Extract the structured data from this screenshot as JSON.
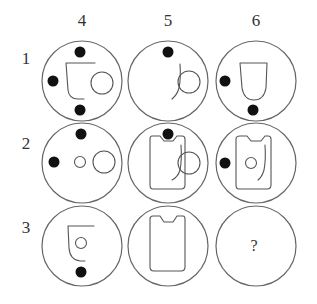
{
  "puzzle": {
    "column_labels": [
      "4",
      "5",
      "6"
    ],
    "row_labels": [
      "1",
      "2",
      "3"
    ],
    "missing_cell_mark": "?",
    "cells": [
      {
        "row": "1",
        "col": "4",
        "contents": [
          "cup-outline",
          "large-circle",
          "dot-top",
          "dot-left",
          "dot-bottom"
        ]
      },
      {
        "row": "1",
        "col": "5",
        "contents": [
          "hook-curve",
          "large-circle",
          "dot-top"
        ]
      },
      {
        "row": "1",
        "col": "6",
        "contents": [
          "tumbler-outline",
          "dot-left",
          "dot-bottom"
        ]
      },
      {
        "row": "2",
        "col": "4",
        "contents": [
          "small-circle",
          "large-circle",
          "dot-top",
          "dot-left"
        ]
      },
      {
        "row": "2",
        "col": "5",
        "contents": [
          "notched-rectangle",
          "hook-curve",
          "large-circle",
          "dot-top"
        ]
      },
      {
        "row": "2",
        "col": "6",
        "contents": [
          "notched-rectangle",
          "small-circle",
          "hook-curve",
          "dot-left"
        ]
      },
      {
        "row": "3",
        "col": "4",
        "contents": [
          "cup-outline",
          "small-circle",
          "dot-bottom"
        ]
      },
      {
        "row": "3",
        "col": "5",
        "contents": [
          "notched-rectangle"
        ]
      },
      {
        "row": "3",
        "col": "6",
        "contents": [
          "question-mark"
        ]
      }
    ]
  }
}
